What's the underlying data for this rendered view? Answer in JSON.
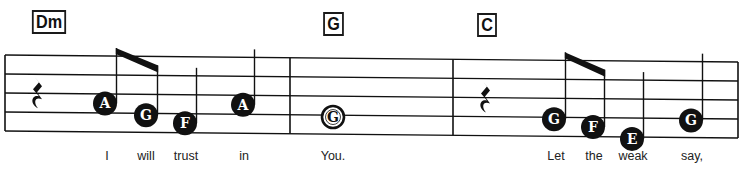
{
  "colors": {
    "ink": "#111111",
    "background": "#ffffff"
  },
  "measures": [
    {
      "chord": "Dm",
      "items": [
        {
          "kind": "rest",
          "duration": "quarter"
        },
        {
          "kind": "note",
          "name": "A",
          "duration": "eighth",
          "beamed": true,
          "lyric": "I"
        },
        {
          "kind": "note",
          "name": "G",
          "duration": "eighth",
          "beamed": true,
          "lyric": "will"
        },
        {
          "kind": "note",
          "name": "F",
          "duration": "quarter",
          "lyric": "trust"
        },
        {
          "kind": "note",
          "name": "A",
          "duration": "quarter",
          "lyric": "in"
        }
      ]
    },
    {
      "chord": "G",
      "items": [
        {
          "kind": "note",
          "name": "G",
          "duration": "whole",
          "lyric": "You."
        }
      ]
    },
    {
      "chord": "C",
      "items": [
        {
          "kind": "rest",
          "duration": "quarter"
        },
        {
          "kind": "note",
          "name": "G",
          "duration": "eighth",
          "beamed": true,
          "lyric": "Let"
        },
        {
          "kind": "note",
          "name": "F",
          "duration": "eighth",
          "beamed": true,
          "lyric": "the"
        },
        {
          "kind": "note",
          "name": "E",
          "duration": "quarter",
          "lyric": "weak"
        },
        {
          "kind": "note",
          "name": "G",
          "duration": "quarter",
          "lyric": "say,"
        }
      ]
    }
  ]
}
